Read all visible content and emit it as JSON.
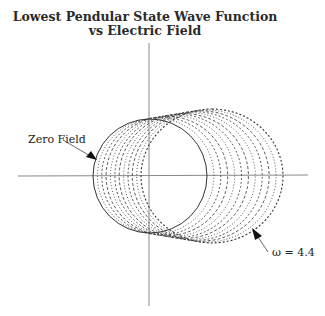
{
  "chart_data": {
    "type": "line",
    "title_lines": [
      "Lowest Pendular State Wave Function",
      "vs Electric Field"
    ],
    "xlabel": "",
    "ylabel": "",
    "grid": false,
    "legend": "none",
    "plot_style": "polar curves of wave function amplitude; family of curves for increasing field strength",
    "annotations": [
      {
        "text": "Zero Field",
        "points_to": "solid circle (omega = 0)"
      },
      {
        "text": "ω = 4.4",
        "points_to": "outermost curve (strongest field)"
      }
    ],
    "series": [
      {
        "name": "Zero Field (ω = 0)",
        "style": "solid",
        "shape": "circle",
        "center_x_rel": 0,
        "radius_rel": 1.0
      },
      {
        "name": "intermediate fields",
        "style": "dotted/dashed",
        "count": 10
      },
      {
        "name": "ω = 4.4",
        "style": "dotted",
        "x_extent_rel": [
          -0.1,
          2.3
        ],
        "y_extent_rel": [
          -1.2,
          1.2
        ]
      }
    ]
  },
  "labels": {
    "zero_field": "Zero Field",
    "omega": "ω = 4.4"
  }
}
